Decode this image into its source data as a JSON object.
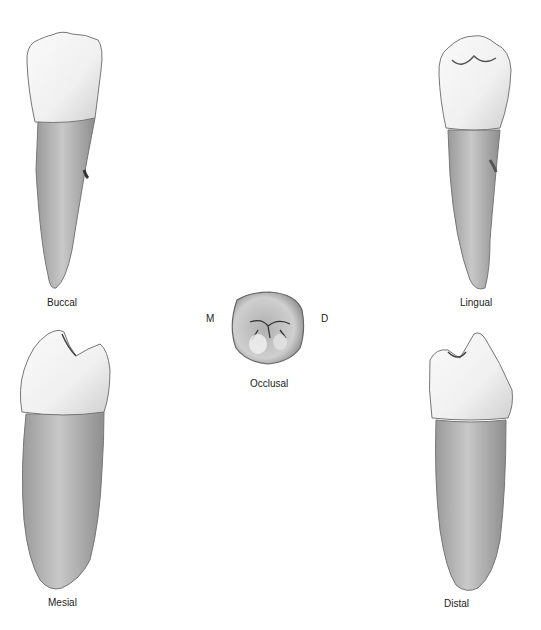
{
  "figure": {
    "views": [
      {
        "id": "buccal",
        "label": "Buccal"
      },
      {
        "id": "lingual",
        "label": "Lingual"
      },
      {
        "id": "occlusal",
        "label": "Occlusal"
      },
      {
        "id": "mesial",
        "label": "Mesial"
      },
      {
        "id": "distal",
        "label": "Distal"
      }
    ],
    "orientation": {
      "mesial_marker": "M",
      "distal_marker": "D"
    }
  },
  "colors": {
    "background": "#ffffff",
    "crown": "#f4f4f4",
    "root": "#b9b9b9",
    "outline": "#6a6a6a",
    "label": "#222222"
  }
}
